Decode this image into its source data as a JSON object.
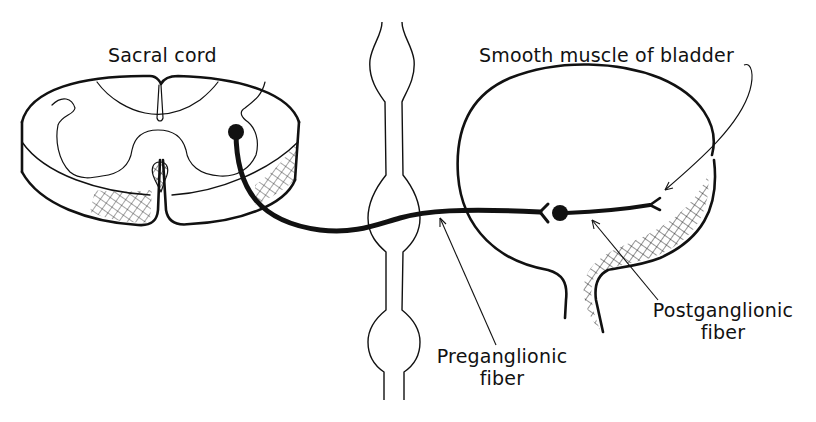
{
  "diagram": {
    "labels": {
      "sacral_cord": "Sacral cord",
      "smooth_muscle": "Smooth muscle of bladder",
      "postganglionic_line1": "Postganglionic",
      "postganglionic_line2": "fiber",
      "preganglionic_line1": "Preganglionic",
      "preganglionic_line2": "fiber"
    },
    "colors": {
      "ink": "#111111",
      "background": "#ffffff"
    },
    "structures": [
      "sacral-spinal-cord-section",
      "sympathetic-chain",
      "bladder"
    ],
    "pathway": [
      "preganglionic-fiber",
      "ganglion-cell",
      "postganglionic-fiber"
    ]
  }
}
